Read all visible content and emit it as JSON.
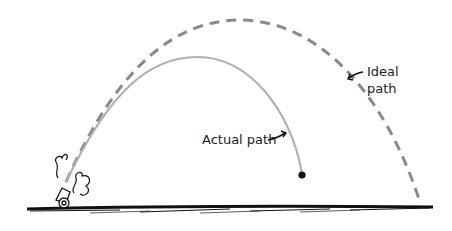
{
  "diagram": {
    "labels": {
      "actual_path": "Actual path",
      "ideal_line1": "Ideal",
      "ideal_line2": "path"
    },
    "elements": {
      "cannon": "cannon-icon",
      "smoke": "smoke-puff",
      "ball": "cannonball",
      "ground": "ground-line"
    },
    "colors": {
      "actual_path": "#b0b0b0",
      "ideal_path": "#8a8a8a",
      "ink": "#111111"
    }
  }
}
